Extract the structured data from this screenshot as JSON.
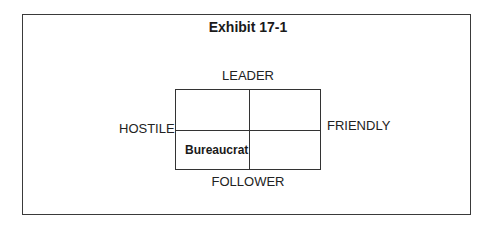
{
  "exhibit": {
    "title": "Exhibit 17-1",
    "axes": {
      "top": "LEADER",
      "bottom": "FOLLOWER",
      "left": "HOSTILE",
      "right": "FRIENDLY"
    },
    "quadrants": {
      "top_left": "",
      "top_right": "",
      "bottom_left": "Bureaucrat",
      "bottom_right": ""
    }
  }
}
